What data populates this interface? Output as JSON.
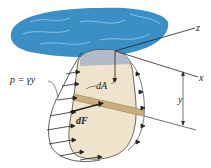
{
  "figure": {
    "labels": {
      "pressure": "p = γy",
      "area_element": "dA",
      "force_element": "dF",
      "axis_z": "z",
      "axis_x": "x",
      "axis_y": "y",
      "depth": "y"
    },
    "colors": {
      "water": "#3a8fc4",
      "water_highlight": "#9fd4f0",
      "plate": "#efe3cc",
      "plate_submerged_top": "#a9b4c4",
      "strip": "#c9ad7c",
      "lines": "#222222"
    }
  }
}
